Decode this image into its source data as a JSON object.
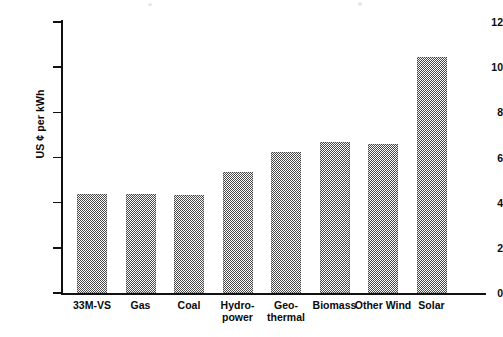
{
  "chart_data": {
    "type": "bar",
    "title": "",
    "subtitle": "",
    "xlabel": "",
    "ylabel": "US ¢ per kWh",
    "categories": [
      "33M-VS",
      "Gas",
      "Coal",
      "Hydro-power",
      "Geo-thermal",
      "Biomass",
      "Other Wind",
      "Solar"
    ],
    "category_lines": [
      [
        "33M-VS"
      ],
      [
        "Gas"
      ],
      [
        "Coal"
      ],
      [
        "Hydro-",
        "power"
      ],
      [
        "Geo-",
        "thermal"
      ],
      [
        "Biomass"
      ],
      [
        "Other Wind"
      ],
      [
        "Solar"
      ]
    ],
    "values": [
      4.4,
      4.4,
      4.35,
      5.35,
      6.25,
      6.7,
      6.6,
      10.45
    ],
    "ylim": [
      0,
      12
    ],
    "ytick_labels": [
      "0",
      "2",
      "4",
      "6",
      "8",
      "10",
      "12"
    ],
    "ytick_values": [
      0,
      2,
      4,
      6,
      8,
      10,
      12
    ],
    "grid": false,
    "legend": false,
    "legend_position": "none",
    "bar_color": "#4a4a4a",
    "axis_color": "#111111",
    "background_color": "#ffffff"
  }
}
